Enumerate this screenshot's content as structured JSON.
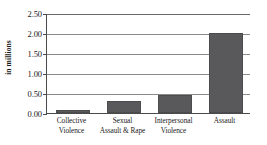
{
  "chart_data": {
    "type": "bar",
    "title": "",
    "subtitle": "",
    "xlabel": "",
    "ylabel": "in millions",
    "categories": [
      "Collective Violence",
      "Sexual Assault & Rape",
      "Interpersonal Violence",
      "Assault"
    ],
    "category_lines": [
      [
        "Collective",
        "Violence"
      ],
      [
        "Sexual",
        "Assault & Rape"
      ],
      [
        "Interpersonal",
        "Violence"
      ],
      [
        "Assault",
        ""
      ]
    ],
    "values": [
      0.07,
      0.29,
      0.45,
      2.0
    ],
    "ylim": [
      0.0,
      2.5
    ],
    "ytick_labels": [
      "2.50",
      "2.00",
      "1.50",
      "1.00",
      "0.50",
      "0.00"
    ],
    "ytick_values": [
      2.5,
      2.0,
      1.5,
      1.0,
      0.5,
      0.0
    ],
    "grid": true,
    "legend": "none",
    "bar_color": "#59595b",
    "axis_color": "#4a4a4a",
    "gridline_color": "#8a8a8a",
    "background_color": "#ffffff"
  }
}
